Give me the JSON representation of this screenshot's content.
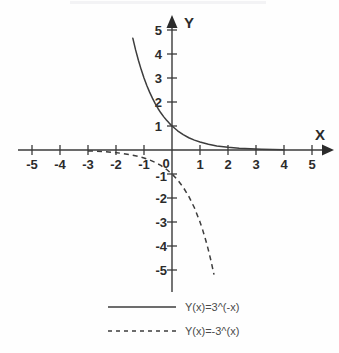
{
  "chart_data": {
    "type": "line",
    "title": "",
    "subtitle": "",
    "xlabel": "X",
    "ylabel": "Y",
    "xlim": [
      -5.6,
      5.6
    ],
    "ylim": [
      -5.9,
      5.9
    ],
    "xticks": [
      -5,
      -4,
      -3,
      -2,
      -1,
      0,
      1,
      2,
      3,
      4,
      5
    ],
    "yticks": [
      -5,
      -4,
      -3,
      -2,
      -1,
      1,
      2,
      3,
      4,
      5
    ],
    "xtick_labels": [
      "-5",
      "-4",
      "-3",
      "-2",
      "-1",
      "0",
      "1",
      "2",
      "3",
      "4",
      "5"
    ],
    "ytick_labels": [
      "-5",
      "-4",
      "-3",
      "-2",
      "-1",
      "1",
      "2",
      "3",
      "4",
      "5"
    ],
    "origin_label": "0",
    "grid": false,
    "legend_position": "bottom",
    "axis_arrows": true,
    "series": [
      {
        "name": "Y(x)=3^(-x)",
        "style": "solid",
        "color": "#3d3d3d",
        "x": [
          -1.5,
          -1.4,
          -1.3,
          -1.2,
          -1.1,
          -1.0,
          -0.9,
          -0.8,
          -0.7,
          -0.6,
          -0.5,
          -0.4,
          -0.3,
          -0.2,
          -0.1,
          0.0,
          0.2,
          0.4,
          0.6,
          0.8,
          1.0,
          1.3,
          1.6,
          2.0,
          2.4,
          2.8,
          3.2,
          3.6,
          4.0
        ],
        "values": [
          5.2,
          4.66,
          4.17,
          3.74,
          3.35,
          3.0,
          2.69,
          2.41,
          2.16,
          1.93,
          1.73,
          1.55,
          1.39,
          1.25,
          1.12,
          1.0,
          0.8,
          0.64,
          0.51,
          0.41,
          0.33,
          0.24,
          0.17,
          0.11,
          0.072,
          0.047,
          0.031,
          0.02,
          0.012
        ]
      },
      {
        "name": "Y(x)=-3^(x)",
        "style": "dashed",
        "color": "#3d3d3d",
        "x": [
          -3.0,
          -2.7,
          -2.4,
          -2.1,
          -1.8,
          -1.5,
          -1.2,
          -1.0,
          -0.8,
          -0.6,
          -0.4,
          -0.2,
          0.0,
          0.2,
          0.4,
          0.6,
          0.8,
          1.0,
          1.1,
          1.2,
          1.3,
          1.4,
          1.5
        ],
        "values": [
          -0.037,
          -0.051,
          -0.071,
          -0.099,
          -0.138,
          -0.192,
          -0.268,
          -0.333,
          -0.415,
          -0.517,
          -0.643,
          -0.803,
          -1.0,
          -1.245,
          -1.552,
          -1.933,
          -2.408,
          -3.0,
          -3.348,
          -3.737,
          -4.171,
          -4.655,
          -5.196
        ]
      }
    ],
    "legend": [
      {
        "label": "Y(x)=3^(-x)",
        "style": "solid"
      },
      {
        "label": "Y(x)=-3^(x)",
        "style": "dashed"
      }
    ]
  }
}
